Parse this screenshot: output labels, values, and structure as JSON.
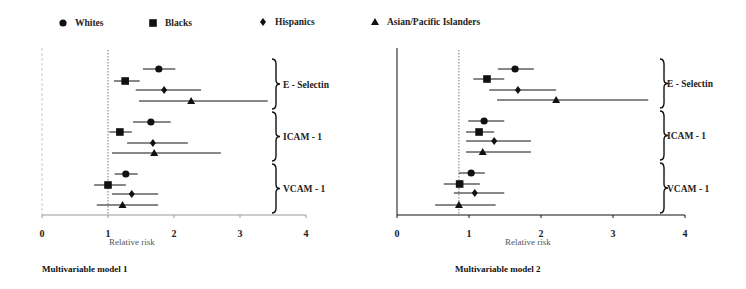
{
  "legend": [
    {
      "name": "Whites",
      "marker": "circle",
      "x": 75,
      "y": 26
    },
    {
      "name": "Blacks",
      "marker": "square",
      "x": 165,
      "y": 26
    },
    {
      "name": "Hispanics",
      "marker": "diamond",
      "x": 275,
      "y": 25
    },
    {
      "name": "Asian/Pacific Islanders",
      "marker": "triangle",
      "x": 387,
      "y": 25
    }
  ],
  "chart_data": [
    {
      "type": "forest",
      "title": "Multivariable model 1",
      "xlabel": "Relative risk",
      "xlim": [
        0,
        4
      ],
      "xticks": [
        0,
        1,
        2,
        3,
        4
      ],
      "reference_line": 1.0,
      "legend_position": "top",
      "groups": [
        "E - Selectin",
        "ICAM - 1",
        "VCAM - 1"
      ],
      "series": [
        {
          "name": "Whites",
          "marker": "circle",
          "values": [
            {
              "group": "E - Selectin",
              "rr": 1.77,
              "lo": 1.53,
              "hi": 2.02
            },
            {
              "group": "ICAM - 1",
              "rr": 1.65,
              "lo": 1.38,
              "hi": 1.95
            },
            {
              "group": "VCAM - 1",
              "rr": 1.27,
              "lo": 1.1,
              "hi": 1.45
            }
          ]
        },
        {
          "name": "Blacks",
          "marker": "square",
          "values": [
            {
              "group": "E - Selectin",
              "rr": 1.26,
              "lo": 1.09,
              "hi": 1.48
            },
            {
              "group": "ICAM - 1",
              "rr": 1.18,
              "lo": 1.02,
              "hi": 1.36
            },
            {
              "group": "VCAM - 1",
              "rr": 1.0,
              "lo": 0.79,
              "hi": 1.27
            }
          ]
        },
        {
          "name": "Hispanics",
          "marker": "diamond",
          "values": [
            {
              "group": "E - Selectin",
              "rr": 1.85,
              "lo": 1.42,
              "hi": 2.41
            },
            {
              "group": "ICAM - 1",
              "rr": 1.68,
              "lo": 1.29,
              "hi": 2.21
            },
            {
              "group": "VCAM - 1",
              "rr": 1.36,
              "lo": 1.06,
              "hi": 1.76
            }
          ]
        },
        {
          "name": "Asian/Pacific Islanders",
          "marker": "triangle",
          "values": [
            {
              "group": "E - Selectin",
              "rr": 2.26,
              "lo": 1.47,
              "hi": 3.42
            },
            {
              "group": "ICAM - 1",
              "rr": 1.7,
              "lo": 1.06,
              "hi": 2.71
            },
            {
              "group": "VCAM - 1",
              "rr": 1.22,
              "lo": 0.83,
              "hi": 1.76
            }
          ]
        }
      ]
    },
    {
      "type": "forest",
      "title": "Multivariable model 2",
      "xlabel": "Relative risk",
      "xlim": [
        0,
        4
      ],
      "xticks": [
        0,
        1,
        2,
        3,
        4
      ],
      "reference_line": 0.86,
      "legend_position": "top",
      "groups": [
        "E - Selectin",
        "ICAM - 1",
        "VCAM - 1"
      ],
      "series": [
        {
          "name": "Whites",
          "marker": "circle",
          "values": [
            {
              "group": "E - Selectin",
              "rr": 1.64,
              "lo": 1.4,
              "hi": 1.9
            },
            {
              "group": "ICAM - 1",
              "rr": 1.21,
              "lo": 0.99,
              "hi": 1.49
            },
            {
              "group": "VCAM - 1",
              "rr": 1.03,
              "lo": 0.86,
              "hi": 1.22
            }
          ]
        },
        {
          "name": "Blacks",
          "marker": "square",
          "values": [
            {
              "group": "E - Selectin",
              "rr": 1.25,
              "lo": 1.06,
              "hi": 1.49
            },
            {
              "group": "ICAM - 1",
              "rr": 1.14,
              "lo": 0.96,
              "hi": 1.35
            },
            {
              "group": "VCAM - 1",
              "rr": 0.87,
              "lo": 0.65,
              "hi": 1.15
            }
          ]
        },
        {
          "name": "Hispanics",
          "marker": "diamond",
          "values": [
            {
              "group": "E - Selectin",
              "rr": 1.68,
              "lo": 1.28,
              "hi": 2.21
            },
            {
              "group": "ICAM - 1",
              "rr": 1.35,
              "lo": 0.96,
              "hi": 1.86
            },
            {
              "group": "VCAM - 1",
              "rr": 1.08,
              "lo": 0.79,
              "hi": 1.49
            }
          ]
        },
        {
          "name": "Asian/Pacific Islanders",
          "marker": "triangle",
          "values": [
            {
              "group": "E - Selectin",
              "rr": 2.21,
              "lo": 1.39,
              "hi": 3.49
            },
            {
              "group": "ICAM - 1",
              "rr": 1.19,
              "lo": 0.96,
              "hi": 1.86
            },
            {
              "group": "VCAM - 1",
              "rr": 0.86,
              "lo": 0.53,
              "hi": 1.37
            }
          ]
        }
      ]
    }
  ],
  "layout": {
    "panels": [
      {
        "x0": 42,
        "px_per_unit": 66,
        "axis_y": 215,
        "y_top": 48,
        "yaxis_style": "faint-dashed",
        "rows_y": [
          [
            69,
            81,
            90,
            101
          ],
          [
            122,
            132,
            143,
            153
          ],
          [
            174,
            185,
            194,
            205
          ]
        ],
        "brace_x": 272,
        "label_x": 283,
        "xlabel_x": 109,
        "xlabel_y": 245,
        "title_x": 42,
        "title_y": 272
      },
      {
        "x0": 397,
        "px_per_unit": 72,
        "axis_y": 215,
        "y_top": 48,
        "yaxis_style": "solid",
        "rows_y": [
          [
            69,
            79,
            90,
            100
          ],
          [
            121,
            132,
            141,
            152
          ],
          [
            173,
            184,
            193,
            205
          ]
        ],
        "brace_x": 660,
        "label_x": 667,
        "xlabel_x": 505,
        "xlabel_y": 245,
        "title_x": 455,
        "title_y": 272
      }
    ],
    "ink": "#111111",
    "tick_color": "#333333",
    "faint_axis_color": "#cccccc"
  }
}
